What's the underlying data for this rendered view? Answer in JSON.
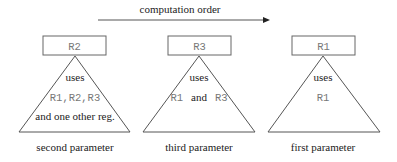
{
  "title": "computation order",
  "colors": {
    "line": "#555555",
    "box_border": "#666666",
    "register_text": "#777777",
    "label_text": "#222222",
    "background": "#ffffff"
  },
  "arrow": {
    "label": "computation order",
    "direction": "right"
  },
  "subtrees": [
    {
      "register": "R2",
      "uses_label": "uses",
      "registers_used": "R1,R2,R3",
      "extra_note": "and one other reg.",
      "caption": "second parameter"
    },
    {
      "register": "R3",
      "uses_label": "uses",
      "registers_used_a": "R1",
      "conjunction": "and",
      "registers_used_b": "R3",
      "caption": "third parameter"
    },
    {
      "register": "R1",
      "uses_label": "uses",
      "registers_used": "R1",
      "caption": "first parameter"
    }
  ]
}
